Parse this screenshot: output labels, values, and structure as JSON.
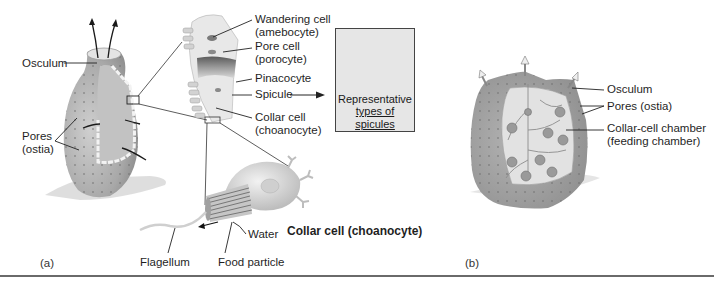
{
  "figure": {
    "panel_a": {
      "label": "(a)",
      "labels": {
        "osculum": "Osculum",
        "pores_line1": "Pores",
        "pores_line2": "(ostia)",
        "wandering_cell_line1": "Wandering cell",
        "wandering_cell_line2": "(amebocyte)",
        "pore_cell_line1": "Pore cell",
        "pore_cell_line2": "(porocyte)",
        "pinacocyte": "Pinacocyte",
        "spicule": "Spicule",
        "collar_cell_line1": "Collar cell",
        "collar_cell_line2": "(choanocyte)",
        "water": "Water",
        "flagellum": "Flagellum",
        "food_particle": "Food particle",
        "collar_cell_title": "Collar cell (choanocyte)"
      },
      "spicule_box": {
        "caption_line1": "Representative",
        "caption_line2": "types of spicules"
      }
    },
    "panel_b": {
      "label": "(b)",
      "labels": {
        "osculum": "Osculum",
        "pores": "Pores (ostia)",
        "chamber_line1": "Collar-cell chamber",
        "chamber_line2": "(feeding chamber)"
      }
    },
    "colors": {
      "sponge_body": "#a9a9a9",
      "sponge_light": "#d9d9d9",
      "line": "#2a2a2a",
      "rule": "#6a6a6a"
    }
  }
}
